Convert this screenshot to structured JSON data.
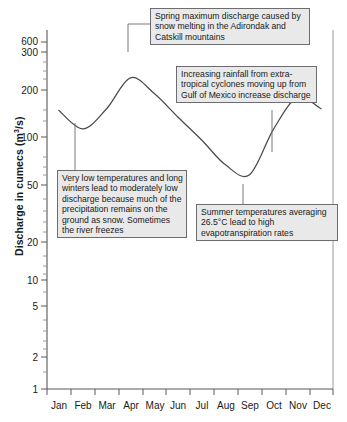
{
  "chart_data": {
    "type": "line",
    "title": "",
    "xlabel": "",
    "ylabel": "Discharge in cumecs (m³/s)",
    "yscale": "log",
    "ylim": [
      1,
      600
    ],
    "ytick_labels": [
      "600",
      "300",
      "200",
      "100",
      "50",
      "20",
      "10",
      "5",
      "2",
      "1"
    ],
    "ytick_values": [
      600,
      300,
      200,
      100,
      50,
      20,
      10,
      5,
      2,
      1
    ],
    "grid": false,
    "legend": "none",
    "categories": [
      "Jan",
      "Feb",
      "Mar",
      "Apr",
      "May",
      "Jun",
      "Jul",
      "Aug",
      "Sep",
      "Oct",
      "Nov",
      "Dec"
    ],
    "series": [
      {
        "name": "Discharge",
        "values": [
          170,
          121,
          175,
          310,
          232,
          150,
          98,
          62,
          52,
          120,
          215,
          175
        ]
      }
    ],
    "annotations": [
      {
        "id": "spring",
        "text": "Spring maximum discharge caused by snow melting in the Adirondak and Catskill mountains",
        "points_to": "Apr"
      },
      {
        "id": "rain",
        "text": "Increasing rainfall from extra-tropical cyclones moving up from Gulf of Mexico increase discharge",
        "points_to": "Oct"
      },
      {
        "id": "winter",
        "text": "Very low temperatures and long winters lead to moderately low discharge because much of the precipitation remains on the ground as snow. Sometimes the river freezes",
        "points_to": "Feb"
      },
      {
        "id": "summer",
        "text": "Summer temperatures averaging 26.5°C lead to high evapotranspiration rates",
        "points_to": "Sep"
      }
    ]
  },
  "axis": {
    "y_title_main": "Discharge in cumecs (m",
    "y_title_sup": "3",
    "y_title_tail": "/s)"
  },
  "colors": {
    "curve": "#4a4a4c",
    "axis": "#58585a",
    "note_fill": "#e9e9e9",
    "note_border": "#6d6d6f",
    "background": "#ffffff"
  }
}
